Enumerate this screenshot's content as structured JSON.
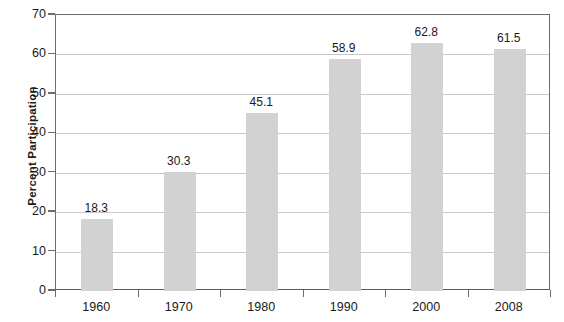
{
  "chart_data": {
    "type": "bar",
    "title": "",
    "subtitle": "",
    "xlabel": "",
    "ylabel": "Percent Participation",
    "categories": [
      "1960",
      "1970",
      "1980",
      "1990",
      "2000",
      "2008"
    ],
    "values": [
      18.3,
      30.3,
      45.1,
      58.9,
      62.8,
      61.5
    ],
    "value_labels": [
      "18.3",
      "30.3",
      "45.1",
      "58.9",
      "62.8",
      "61.5"
    ],
    "ylim": [
      0,
      70
    ],
    "ytick_labels": [
      "0",
      "10",
      "20",
      "30",
      "40",
      "50",
      "60",
      "70"
    ],
    "ytick_values": [
      0,
      10,
      20,
      30,
      40,
      50,
      60,
      70
    ],
    "grid": true,
    "grid_axis": "y",
    "legend": false,
    "legend_position": "none",
    "bar_color": "#d2d2d2",
    "axis_color": "#6b6b6b",
    "grid_color": "#c9c9c9",
    "text_color": "#1a1a1a",
    "background_color": "#ffffff"
  }
}
